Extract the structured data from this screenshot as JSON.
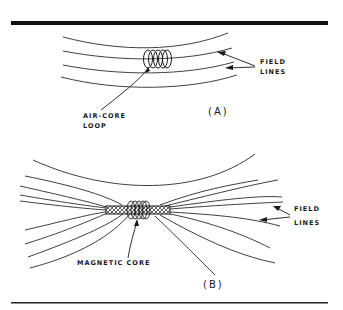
{
  "figure": {
    "panel_a": {
      "caption": "(A)",
      "coil_label_line1": "AIR-CORE",
      "coil_label_line2": "LOOP",
      "field_label_line1": "FIELD",
      "field_label_line2": "LINES"
    },
    "panel_b": {
      "caption": "(B)",
      "core_label": "MAGNETIC CORE",
      "field_label_line1": "FIELD",
      "field_label_line2": "LINES"
    },
    "colors": {
      "ink": "#1a1a1a",
      "background": "#ffffff"
    }
  }
}
